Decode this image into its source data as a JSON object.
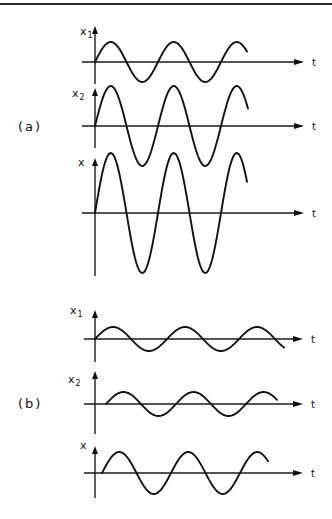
{
  "figure": {
    "parts": [
      {
        "label": "(a)",
        "label_pos": [
          18,
          131
        ],
        "panels": [
          {
            "name": "x1",
            "ylabel": "x",
            "ylabel_sub": "1",
            "ylabel_pos": [
              80,
              35
            ],
            "xlabel": "t",
            "origin": [
              95,
              62
            ],
            "axis_top": 26,
            "axis_bottom": 84,
            "axis_left": 82,
            "axis_right": 304,
            "wave": {
              "start": 95,
              "end": 247,
              "period": 63,
              "amplitude": 20,
              "phase_px": 0
            }
          },
          {
            "name": "x2",
            "ylabel": "x",
            "ylabel_sub": "2",
            "ylabel_pos": [
              72,
              97
            ],
            "xlabel": "t",
            "origin": [
              95,
              126
            ],
            "axis_top": 88,
            "axis_bottom": 148,
            "axis_left": 82,
            "axis_right": 304,
            "wave": {
              "start": 95,
              "end": 248,
              "period": 63,
              "amplitude": 40,
              "phase_px": 0
            }
          },
          {
            "name": "x",
            "ylabel": "x",
            "ylabel_sub": "",
            "ylabel_pos": [
              78,
              166
            ],
            "xlabel": "t",
            "origin": [
              95,
              213
            ],
            "axis_top": 158,
            "axis_bottom": 276,
            "axis_left": 82,
            "axis_right": 304,
            "wave": {
              "start": 95,
              "end": 247,
              "period": 63,
              "amplitude": 60,
              "phase_px": 0
            }
          }
        ]
      },
      {
        "label": "(b)",
        "label_pos": [
          18,
          408
        ],
        "panels": [
          {
            "name": "x1",
            "ylabel": "x",
            "ylabel_sub": "1",
            "ylabel_pos": [
              70,
              314
            ],
            "xlabel": "t",
            "origin": [
              95,
              339
            ],
            "axis_top": 310,
            "axis_bottom": 362,
            "axis_left": 84,
            "axis_right": 303,
            "wave": {
              "start": 95,
              "end": 284,
              "period": 72,
              "amplitude": 12,
              "phase_px": 0
            }
          },
          {
            "name": "x2",
            "ylabel": "x",
            "ylabel_sub": "2",
            "ylabel_pos": [
              68,
              383
            ],
            "xlabel": "t",
            "origin": [
              95,
              404
            ],
            "axis_top": 371,
            "axis_bottom": 434,
            "axis_left": 84,
            "axis_right": 303,
            "wave": {
              "start": 106,
              "end": 277,
              "period": 70,
              "amplitude": 12,
              "phase_px": 11
            }
          },
          {
            "name": "x",
            "ylabel": "x",
            "ylabel_sub": "",
            "ylabel_pos": [
              80,
              449
            ],
            "xlabel": "t",
            "origin": [
              95,
              473
            ],
            "axis_top": 446,
            "axis_bottom": 498,
            "axis_left": 84,
            "axis_right": 303,
            "wave": {
              "start": 102,
              "end": 268,
              "period": 69,
              "amplitude": 21,
              "phase_px": 7
            }
          }
        ]
      }
    ],
    "colors": {
      "ink": "#111111",
      "paper": "#ffffff"
    }
  }
}
